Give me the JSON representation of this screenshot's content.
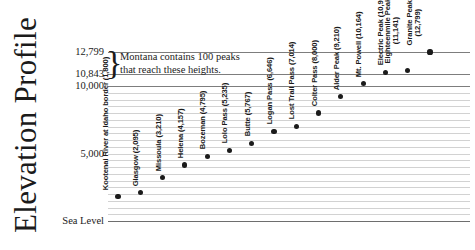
{
  "title": "Elevation Profile",
  "annotation": {
    "text": "Montana contains 100 peaks\nthat reach these heights.",
    "brace": "}"
  },
  "axis": {
    "ticks": [
      {
        "label": "12,799",
        "value": 12799
      },
      {
        "label": "10,843",
        "value": 10843
      },
      {
        "label": "10,000",
        "value": 10000
      },
      {
        "label": "5,000",
        "value": 5000
      },
      {
        "label": "Sea Level",
        "value": 0
      }
    ]
  },
  "chart_data": {
    "type": "scatter",
    "title": "Elevation Profile",
    "xlabel": "",
    "ylabel": "Elevation (feet)",
    "ylim": [
      0,
      13400
    ],
    "grid": true,
    "legend": "none",
    "annotations": [
      {
        "text": "Montana contains 100 peaks that reach these heights.",
        "spans": [
          10843,
          12799
        ]
      }
    ],
    "ytick_labels": [
      "Sea Level",
      "5,000",
      "10,000",
      "10,843",
      "12,799"
    ],
    "ytick_values": [
      0,
      5000,
      10000,
      10843,
      12799
    ],
    "gridline_values": [
      0,
      500,
      1000,
      1500,
      2000,
      2500,
      3000,
      3500,
      4000,
      4500,
      5000,
      5500,
      6000,
      6500,
      7000,
      7500,
      8000,
      8500,
      9000,
      9500,
      10000,
      10843,
      12799
    ],
    "categories": [
      "Kootenai River at Idaho border",
      "Glasgow",
      "Missoula",
      "Helena",
      "Bozeman",
      "Lolo Pass",
      "Butte",
      "Logan Pass",
      "Lost Trail Pass",
      "Colter Pass",
      "Alder Peak",
      "Mt. Powell",
      "Electric Peak",
      "Eighteenmile Peak",
      "Granite Peak"
    ],
    "values": [
      1800,
      2095,
      3210,
      4157,
      4795,
      5235,
      5767,
      6646,
      7014,
      8000,
      9210,
      10164,
      10992,
      11141,
      12799
    ],
    "points": [
      {
        "label": "Kootenai River at Idaho border (1,800)",
        "name": "Kootenai River at Idaho border",
        "value": 1800,
        "two_line": true
      },
      {
        "label": "Glasgow (2,095)",
        "name": "Glasgow",
        "value": 2095,
        "two_line": false
      },
      {
        "label": "Missoula (3,210)",
        "name": "Missoula",
        "value": 3210,
        "two_line": false
      },
      {
        "label": "Helena (4,157)",
        "name": "Helena",
        "value": 4157,
        "two_line": false
      },
      {
        "label": "Bozeman (4,795)",
        "name": "Bozeman",
        "value": 4795,
        "two_line": false
      },
      {
        "label": "Lolo Pass (5,235)",
        "name": "Lolo Pass",
        "value": 5235,
        "two_line": false
      },
      {
        "label": "Butte (5,767)",
        "name": "Butte",
        "value": 5767,
        "two_line": false
      },
      {
        "label": "Logan Pass (6,646)",
        "name": "Logan Pass",
        "value": 6646,
        "two_line": false
      },
      {
        "label": "Lost Trail Pass (7,014)",
        "name": "Lost Trail Pass",
        "value": 7014,
        "two_line": false
      },
      {
        "label": "Colter Pass (8,000)",
        "name": "Colter Pass",
        "value": 8000,
        "two_line": false
      },
      {
        "label": "Alder Peak (9,210)",
        "name": "Alder Peak",
        "value": 9210,
        "two_line": false
      },
      {
        "label": "Mt. Powell (10,164)",
        "name": "Mt. Powell",
        "value": 10164,
        "two_line": false
      },
      {
        "label": "Electric Peak (10,992)",
        "name": "Electric Peak",
        "value": 10992,
        "two_line": false
      },
      {
        "label": "Eighteenmile Peak\n(11,141)",
        "name": "Eighteenmile Peak",
        "value": 11141,
        "two_line": true
      },
      {
        "label": "Granite Peak\n(12,799)",
        "name": "Granite Peak",
        "value": 12799,
        "two_line": true
      }
    ]
  },
  "colors": {
    "ink": "#1b1b1b",
    "grid_major": "#7d7d7d",
    "grid_minor": "#d2d2d2",
    "dot": "#1b1b1b",
    "background": "#ffffff"
  }
}
